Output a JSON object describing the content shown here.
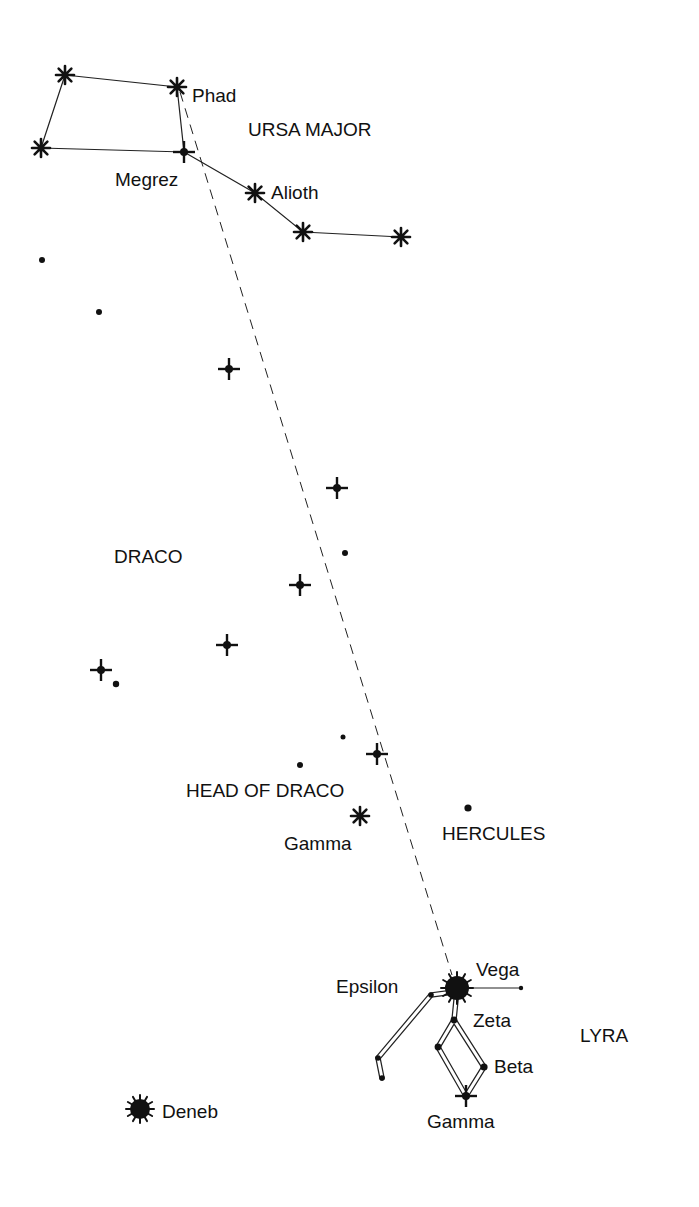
{
  "constellations": [
    {
      "name": "URSA MAJOR",
      "x": 248,
      "y": 136
    },
    {
      "name": "DRACO",
      "x": 114,
      "y": 563
    },
    {
      "name": "HEAD OF DRACO",
      "x": 186,
      "y": 797
    },
    {
      "name": "HERCULES",
      "x": 442,
      "y": 840
    },
    {
      "name": "LYRA",
      "x": 580,
      "y": 1042
    }
  ],
  "star_labels": [
    {
      "name": "Phad",
      "x": 192,
      "y": 102
    },
    {
      "name": "Megrez",
      "x": 115,
      "y": 186
    },
    {
      "name": "Alioth",
      "x": 271,
      "y": 199
    },
    {
      "name": "Gamma",
      "x": 284,
      "y": 850
    },
    {
      "name": "Vega",
      "x": 476,
      "y": 976
    },
    {
      "name": "Epsilon",
      "x": 336,
      "y": 993
    },
    {
      "name": "Zeta",
      "x": 473,
      "y": 1027
    },
    {
      "name": "Beta",
      "x": 494,
      "y": 1073
    },
    {
      "name": "Gamma",
      "x": 427,
      "y": 1128
    },
    {
      "name": "Deneb",
      "x": 162,
      "y": 1118
    }
  ],
  "stars": {
    "asterisk": [
      {
        "name": "ursa-major-star-1",
        "x": 65,
        "y": 75
      },
      {
        "name": "phad",
        "x": 177,
        "y": 87
      },
      {
        "name": "ursa-major-star-3",
        "x": 41,
        "y": 148
      },
      {
        "name": "alioth",
        "x": 255,
        "y": 193
      },
      {
        "name": "ursa-major-star-6",
        "x": 303,
        "y": 232
      },
      {
        "name": "ursa-major-star-7",
        "x": 401,
        "y": 237
      },
      {
        "name": "head-of-draco-gamma",
        "x": 360,
        "y": 816
      }
    ],
    "cross": [
      {
        "name": "megrez",
        "x": 184,
        "y": 152
      },
      {
        "name": "draco-star-a",
        "x": 229,
        "y": 369
      },
      {
        "name": "draco-star-b",
        "x": 337,
        "y": 488
      },
      {
        "name": "draco-star-c",
        "x": 300,
        "y": 585
      },
      {
        "name": "draco-star-d",
        "x": 227,
        "y": 645
      },
      {
        "name": "draco-star-e",
        "x": 101,
        "y": 670
      },
      {
        "name": "head-of-draco-star",
        "x": 377,
        "y": 754
      },
      {
        "name": "lyra-gamma",
        "x": 466,
        "y": 1096
      }
    ],
    "dot": [
      {
        "name": "dot-1",
        "x": 42,
        "y": 260,
        "r": 3
      },
      {
        "name": "dot-2",
        "x": 99,
        "y": 312,
        "r": 3
      },
      {
        "name": "dot-3",
        "x": 345,
        "y": 553,
        "r": 3
      },
      {
        "name": "dot-4",
        "x": 116,
        "y": 684,
        "r": 3.2
      },
      {
        "name": "dot-5",
        "x": 343,
        "y": 737,
        "r": 2.5
      },
      {
        "name": "dot-6",
        "x": 300,
        "y": 765,
        "r": 3
      },
      {
        "name": "hercules-dot",
        "x": 468,
        "y": 808,
        "r": 3.6
      },
      {
        "name": "lyra-east-dot",
        "x": 521,
        "y": 988,
        "r": 2.2
      },
      {
        "name": "epsilon-dot",
        "x": 431,
        "y": 995,
        "r": 2.8
      },
      {
        "name": "zeta-dot",
        "x": 454,
        "y": 1020,
        "r": 3.4
      },
      {
        "name": "lyra-delta-dot",
        "x": 438,
        "y": 1047,
        "r": 3.4
      },
      {
        "name": "beta-dot",
        "x": 484,
        "y": 1067,
        "r": 3.6
      },
      {
        "name": "lyra-west-dot-1",
        "x": 378,
        "y": 1058,
        "r": 2.8
      },
      {
        "name": "lyra-west-dot-2",
        "x": 382,
        "y": 1078,
        "r": 2.8
      }
    ],
    "sunburst": [
      {
        "name": "vega",
        "x": 457,
        "y": 988,
        "r": 12
      },
      {
        "name": "deneb",
        "x": 140,
        "y": 1109,
        "r": 10
      }
    ]
  },
  "colors": {
    "ink": "#111111",
    "background": "#ffffff"
  }
}
